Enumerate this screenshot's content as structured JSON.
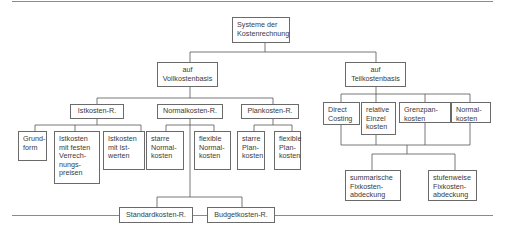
{
  "diagram": {
    "root": {
      "label": "Systeme der\nKostenrechnung"
    },
    "branches": [
      {
        "label": "auf\nVollkostenbasis",
        "children": [
          {
            "label": "Istkosten-R.",
            "children": [
              {
                "label": "Grund-\nform"
              },
              {
                "label": "Istkosten\nmit festen\nVerrech-\nnungs-\npreisen"
              },
              {
                "label": "Istkosten\nmit Ist-\nwerten"
              }
            ]
          },
          {
            "label": "Normalkosten-R.",
            "children": [
              {
                "label": "starre\nNormal-\nkosten"
              },
              {
                "label": "flexible\nNormal-\nkosten"
              }
            ],
            "sub_systems": [
              {
                "label": "Standardkosten-R."
              },
              {
                "label": "Budgetkosten-R."
              }
            ]
          },
          {
            "label": "Plankosten-R.",
            "children": [
              {
                "label": "starre\nPlan-\nkosten"
              },
              {
                "label": "flexible\nPlan-\nkosten"
              }
            ]
          }
        ]
      },
      {
        "label": "auf\nTeilkostenbasis",
        "children": [
          {
            "label": "Direct\nCosting"
          },
          {
            "label": "relative\nEinzel\nkosten"
          },
          {
            "label": "Grenzpan-\nkosten"
          },
          {
            "label": "Normal-\nkosten"
          }
        ],
        "coverage": [
          {
            "label": "summarische\nFixkosten-\nabdeckung"
          },
          {
            "label": "stufenweise\nFixkosten-\nabdeckung"
          }
        ]
      }
    ]
  }
}
